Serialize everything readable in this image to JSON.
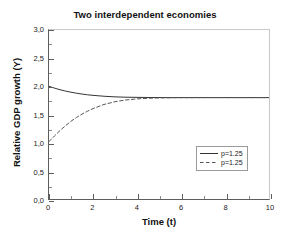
{
  "chart_data": {
    "type": "line",
    "title": "Two interdependent economies",
    "xlabel": "Time (t)",
    "ylabel": "Relative GDP growth (Y)",
    "xlim": [
      0,
      10
    ],
    "ylim": [
      0.0,
      3.0
    ],
    "x_ticks": [
      "0",
      "2",
      "4",
      "6",
      "8",
      "10"
    ],
    "x_tick_values": [
      0,
      2,
      4,
      6,
      8,
      10
    ],
    "y_ticks": [
      "0,0",
      "0,5",
      "1,0",
      "1,5",
      "2,0",
      "2,5",
      "3,0"
    ],
    "y_tick_values": [
      0.0,
      0.5,
      1.0,
      1.5,
      2.0,
      2.5,
      3.0
    ],
    "grid": false,
    "legend_position": "center-right",
    "x": [
      0,
      0.25,
      0.5,
      0.75,
      1,
      1.25,
      1.5,
      1.75,
      2,
      2.5,
      3,
      3.5,
      4,
      4.5,
      5,
      5.5,
      6,
      6.5,
      7,
      7.5,
      8,
      8.5,
      9,
      9.5,
      10
    ],
    "series": [
      {
        "name": "p=1.25",
        "style": "solid",
        "color": "#333333",
        "values": [
          2.0,
          1.968,
          1.94,
          1.916,
          1.895,
          1.878,
          1.863,
          1.85,
          1.84,
          1.824,
          1.813,
          1.807,
          1.804,
          1.802,
          1.801,
          1.8,
          1.8,
          1.8,
          1.8,
          1.8,
          1.8,
          1.8,
          1.8,
          1.8,
          1.8
        ]
      },
      {
        "name": "p=1.25",
        "style": "dashed",
        "color": "#555555",
        "values": [
          1.02,
          1.12,
          1.215,
          1.3,
          1.38,
          1.447,
          1.507,
          1.559,
          1.605,
          1.678,
          1.727,
          1.758,
          1.777,
          1.788,
          1.794,
          1.797,
          1.799,
          1.799,
          1.8,
          1.8,
          1.8,
          1.8,
          1.8,
          1.8,
          1.8
        ]
      }
    ],
    "annotations": {
      "steady_state": 1.8,
      "solid_initial_value": 2.0,
      "dashed_initial_value": 1.0
    }
  },
  "legend": {
    "entries": [
      {
        "label": "p=1.25",
        "style": "solid"
      },
      {
        "label": "p=1.25",
        "style": "dashed"
      }
    ]
  }
}
